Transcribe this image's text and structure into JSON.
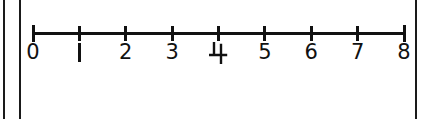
{
  "figure": {
    "kind": "number-line",
    "ink_color": "#111111",
    "background_color": "#ffffff",
    "page_rules": [
      {
        "name": "page-edge-rule-outer"
      },
      {
        "name": "page-edge-rule-inner"
      },
      {
        "name": "page-edge-rule-right"
      }
    ]
  },
  "chart_data": {
    "type": "line",
    "title": "",
    "subtitle": "",
    "xlabel": "",
    "ylabel": "",
    "grid": false,
    "legend": null,
    "axis_orientation": "horizontal",
    "xlim": [
      0,
      8
    ],
    "tick_values": [
      0,
      1,
      2,
      3,
      4,
      5,
      6,
      7,
      8
    ],
    "tick_labels": [
      "0",
      "1",
      "2",
      "3",
      "4",
      "5",
      "6",
      "7",
      "8"
    ],
    "tick_interval": 1,
    "minor_ticks": false,
    "arrowheads": false,
    "plotted_points": [],
    "annotations": []
  }
}
